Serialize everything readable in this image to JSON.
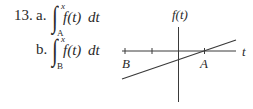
{
  "problem": {
    "number": "13.",
    "parts": [
      {
        "label": "a.",
        "integral_sign": "∫",
        "upper_limit": "x",
        "lower_limit": "A",
        "integrand": "f(t)",
        "differential": "dt"
      },
      {
        "label": "b.",
        "integral_sign": "∫",
        "upper_limit": "x",
        "lower_limit": "B",
        "integrand": "f(t)",
        "differential": "dt"
      }
    ]
  },
  "graph": {
    "y_axis_label": "f(t)",
    "x_axis_label": "t",
    "points": [
      {
        "name": "B",
        "label": "B"
      },
      {
        "name": "A",
        "label": "A"
      }
    ],
    "line_color": "#3a3a3a",
    "axis_color": "#3a3a3a"
  }
}
